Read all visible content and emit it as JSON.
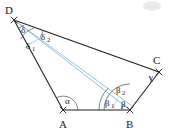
{
  "figure": {
    "background_color": "#ffffff",
    "edge_color": "#1f1f1f",
    "cevian_color": "#7fb8d8",
    "arc_color": "#4a4a4a"
  },
  "vertices": [
    {
      "id": "D",
      "label": "D",
      "x": 14,
      "y": 20,
      "label_x": 7,
      "label_y": 13
    },
    {
      "id": "C",
      "label": "C",
      "x": 159,
      "y": 72,
      "label_x": 155,
      "label_y": 65
    },
    {
      "id": "B",
      "label": "B",
      "x": 130,
      "y": 110,
      "label_x": 126,
      "label_y": 128
    },
    {
      "id": "A",
      "label": "A",
      "x": 63,
      "y": 110,
      "label_x": 59,
      "label_y": 128
    }
  ],
  "edges": [
    {
      "id": "DC",
      "from": "D",
      "to": "C"
    },
    {
      "id": "CB",
      "from": "C",
      "to": "B"
    },
    {
      "id": "BA",
      "from": "B",
      "to": "A"
    },
    {
      "id": "AD",
      "from": "A",
      "to": "D"
    }
  ],
  "cevians": [
    {
      "id": "DB",
      "from": "D",
      "to": "B",
      "color": "#7fb8d8"
    }
  ],
  "angles": [
    {
      "id": "delta",
      "label": "δ",
      "sub": "",
      "vertex": "D",
      "label_x": 21,
      "label_y": 33
    },
    {
      "id": "delta1",
      "label": "δ",
      "sub": "1",
      "vertex": "D",
      "label_x": 26,
      "label_y": 48
    },
    {
      "id": "delta2",
      "label": "δ",
      "sub": "2",
      "vertex": "D",
      "label_x": 41,
      "label_y": 40
    },
    {
      "id": "alpha",
      "label": "α",
      "sub": "",
      "vertex": "A",
      "label_x": 68,
      "label_y": 103
    },
    {
      "id": "beta1",
      "label": "β",
      "sub": "1",
      "vertex": "B",
      "label_x": 107,
      "label_y": 105
    },
    {
      "id": "beta2",
      "label": "β",
      "sub": "2",
      "vertex": "B",
      "label_x": 119,
      "label_y": 93
    },
    {
      "id": "beta",
      "label": "β",
      "sub": "",
      "vertex": "B",
      "label_x": 123,
      "label_y": 106
    },
    {
      "id": "gamma",
      "label": "γ",
      "sub": "",
      "vertex": "C",
      "label_x": 150,
      "label_y": 79
    }
  ]
}
